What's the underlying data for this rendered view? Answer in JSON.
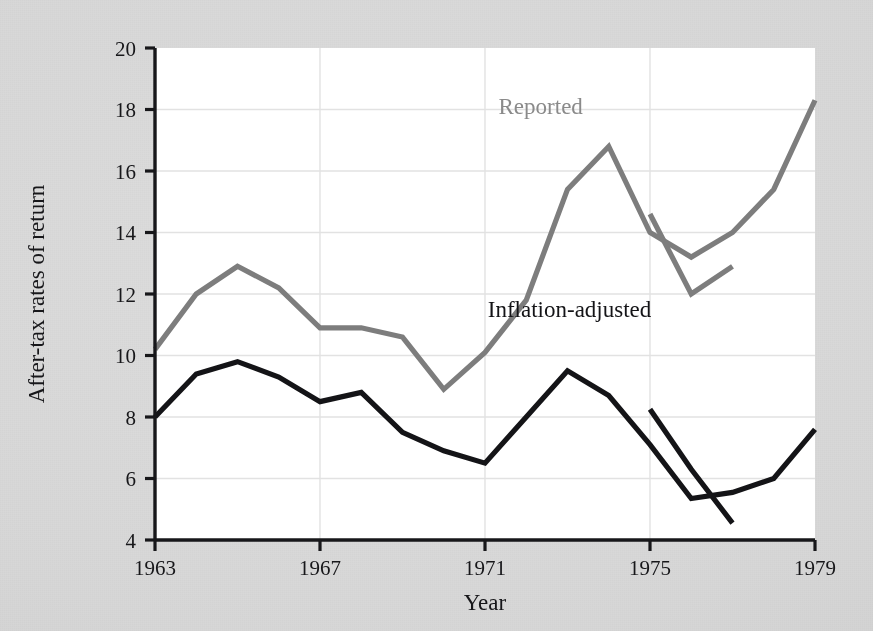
{
  "chart_data": {
    "type": "line",
    "title": "",
    "subtitle": "",
    "xlabel": "Year",
    "ylabel": "After-tax rates of return",
    "xlim": [
      1963,
      1979
    ],
    "ylim": [
      4,
      20
    ],
    "ytick_labels": [
      "4",
      "6",
      "8",
      "10",
      "12",
      "14",
      "16",
      "18",
      "20"
    ],
    "ytick_values": [
      4,
      6,
      8,
      10,
      12,
      14,
      16,
      18,
      20
    ],
    "xtick_labels": [
      "1963",
      "1967",
      "1971",
      "1975",
      "1979"
    ],
    "xtick_values": [
      1963,
      1967,
      1971,
      1975,
      1979
    ],
    "grid": "horizontal-and-vertical-light",
    "legend_position": "inline-annotations",
    "colors": {
      "reported": "#7d7d7d",
      "inflation_adjusted": "#141417",
      "plot_background": "#ffffff",
      "page_background": "#d9d9d9",
      "axis": "#17171a",
      "gridline": "#e2e2e2"
    },
    "annotations": [
      {
        "text": "Reported",
        "x": 1972.35,
        "y": 17.85,
        "color": "#8a8a8a"
      },
      {
        "text": "Inflation-adjusted",
        "x": 1973.05,
        "y": 11.25,
        "color": "#141417"
      }
    ],
    "series": [
      {
        "name": "Reported",
        "color": "#7d7d7d",
        "x": [
          1963,
          1964,
          1965,
          1966,
          1967,
          1968,
          1969,
          1970,
          1971,
          1972,
          1973,
          1974,
          1975,
          1976,
          1977,
          1978,
          1979
        ],
        "values": [
          10.2,
          12.0,
          12.9,
          12.2,
          10.9,
          10.9,
          10.6,
          8.9,
          10.1,
          11.8,
          15.4,
          16.8,
          14.0,
          13.2,
          14.0,
          15.4,
          18.3
        ]
      },
      {
        "name": "Reported (revised basis)",
        "color": "#7d7d7d",
        "x": [
          1975,
          1976,
          1977
        ],
        "values": [
          14.6,
          12.0,
          12.9
        ]
      },
      {
        "name": "Inflation-adjusted",
        "color": "#141417",
        "x": [
          1963,
          1964,
          1965,
          1966,
          1967,
          1968,
          1969,
          1970,
          1971,
          1972,
          1973,
          1974,
          1975,
          1976,
          1977,
          1978,
          1979
        ],
        "values": [
          8.0,
          9.4,
          9.8,
          9.3,
          8.5,
          8.8,
          7.5,
          6.9,
          6.5,
          8.0,
          9.5,
          8.7,
          7.1,
          5.35,
          5.55,
          6.0,
          7.6
        ]
      },
      {
        "name": "Inflation-adjusted (revised basis)",
        "color": "#141417",
        "x": [
          1975,
          1976,
          1977
        ],
        "values": [
          8.25,
          6.3,
          4.55
        ]
      }
    ]
  }
}
